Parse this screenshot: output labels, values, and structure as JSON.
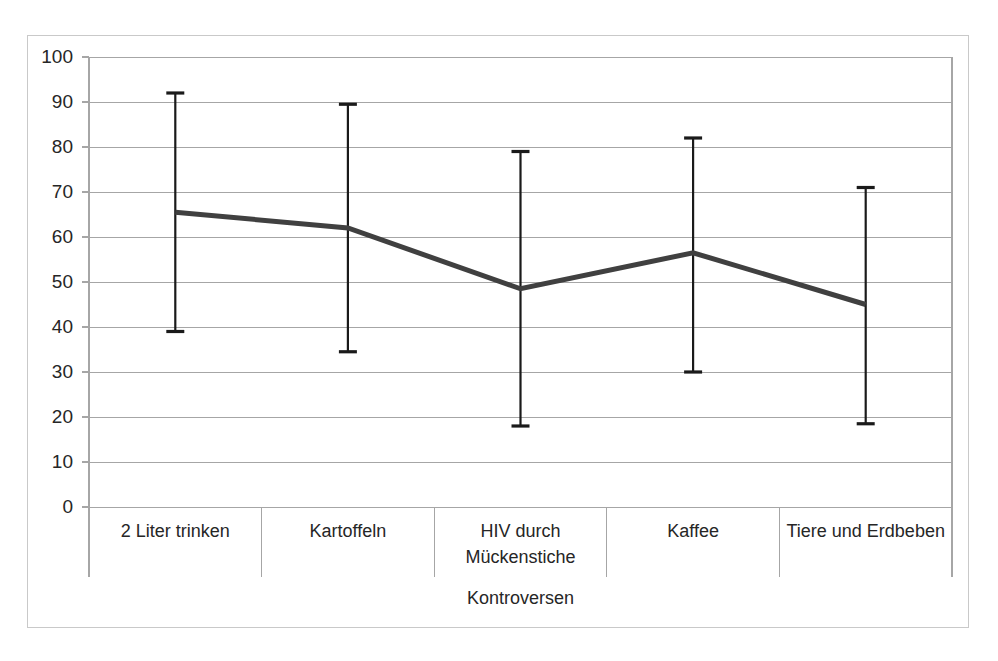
{
  "chart_data": {
    "type": "line",
    "title": "",
    "subtitle": "",
    "xlabel": "Kontroversen",
    "ylabel": "",
    "categories": [
      "2 Liter trinken",
      "Kartoffeln",
      "HIV durch\nMückenstiche",
      "Kaffee",
      "Tiere und Erdbeben"
    ],
    "category_labels_multiline": [
      [
        "2 Liter trinken"
      ],
      [
        "Kartoffeln"
      ],
      [
        "HIV durch",
        "Mückenstiche"
      ],
      [
        "Kaffee"
      ],
      [
        "Tiere und Erdbeben"
      ]
    ],
    "values": [
      65.5,
      62,
      48.5,
      56.5,
      45
    ],
    "error_bars": {
      "lower": [
        39,
        34.5,
        18,
        30,
        18.5
      ],
      "upper": [
        92,
        89.5,
        79,
        82,
        71
      ]
    },
    "ylim": [
      0,
      100
    ],
    "ytick_values": [
      0,
      10,
      20,
      30,
      40,
      50,
      60,
      70,
      80,
      90,
      100
    ],
    "ytick_labels": [
      "0",
      "10",
      "20",
      "30",
      "40",
      "50",
      "60",
      "70",
      "80",
      "90",
      "100"
    ],
    "grid": true,
    "grid_axis": "y",
    "legend": false,
    "legend_position": "none",
    "series": [
      {
        "name": "Kontroversen",
        "values": [
          65.5,
          62,
          48.5,
          56.5,
          45
        ],
        "error_lower": [
          39,
          34.5,
          18,
          30,
          18.5
        ],
        "error_upper": [
          92,
          89.5,
          79,
          82,
          71
        ],
        "line_color": "#404040",
        "error_color": "#1a1a1a"
      }
    ],
    "colors": {
      "line": "#404040",
      "error_bar": "#1a1a1a",
      "gridline": "#a6a6a6",
      "axis": "#a6a6a6",
      "frame": "#c9c9c9",
      "text": "#262626",
      "background": "#ffffff"
    }
  },
  "axis": {
    "y_title": "",
    "x_title": "Kontroversen"
  }
}
